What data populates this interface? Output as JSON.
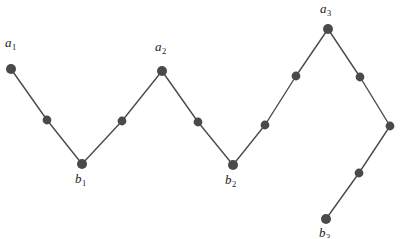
{
  "figure": {
    "type": "zigzag-path-diagram",
    "width": 400,
    "height": 238,
    "background_color": "#ffffff",
    "line_color": "#4a4a4a",
    "node_color": "#4a4a4a",
    "label_color": "#1a1a1a",
    "line_width": 1.4,
    "node_radius_labeled": 5.0,
    "node_radius_intermediate": 4.4
  },
  "path": {
    "description": "Polyline through all marked points from left to right",
    "points": [
      {
        "id": "a1",
        "x": 11,
        "y": 69,
        "labeled": true,
        "kind": "peak"
      },
      {
        "id": "p1",
        "x": 47,
        "y": 120,
        "labeled": false,
        "kind": "intermediate"
      },
      {
        "id": "b1",
        "x": 82,
        "y": 164,
        "labeled": true,
        "kind": "valley"
      },
      {
        "id": "p2",
        "x": 122,
        "y": 121,
        "labeled": false,
        "kind": "intermediate"
      },
      {
        "id": "a2",
        "x": 162,
        "y": 71,
        "labeled": true,
        "kind": "peak"
      },
      {
        "id": "p3",
        "x": 198,
        "y": 122,
        "labeled": false,
        "kind": "intermediate"
      },
      {
        "id": "b2",
        "x": 233,
        "y": 165,
        "labeled": true,
        "kind": "valley"
      },
      {
        "id": "p4",
        "x": 265,
        "y": 125,
        "labeled": false,
        "kind": "intermediate"
      },
      {
        "id": "p5",
        "x": 296,
        "y": 76,
        "labeled": false,
        "kind": "intermediate"
      },
      {
        "id": "a3",
        "x": 328,
        "y": 29,
        "labeled": true,
        "kind": "peak"
      },
      {
        "id": "p6",
        "x": 360,
        "y": 77,
        "labeled": false,
        "kind": "intermediate"
      },
      {
        "id": "p7",
        "x": 390,
        "y": 126,
        "labeled": false,
        "kind": "corner"
      },
      {
        "id": "p8",
        "x": 359,
        "y": 173,
        "labeled": false,
        "kind": "intermediate"
      },
      {
        "id": "b3",
        "x": 326,
        "y": 219,
        "labeled": true,
        "kind": "valley"
      }
    ]
  },
  "labels": [
    {
      "id": "a1",
      "base": "a",
      "sub": "1",
      "x": 5,
      "y": 36
    },
    {
      "id": "b1",
      "base": "b",
      "sub": "1",
      "x": 75,
      "y": 172
    },
    {
      "id": "a2",
      "base": "a",
      "sub": "2",
      "x": 155,
      "y": 40
    },
    {
      "id": "b2",
      "base": "b",
      "sub": "2",
      "x": 225,
      "y": 173
    },
    {
      "id": "a3",
      "base": "a",
      "sub": "3",
      "x": 320,
      "y": 2
    },
    {
      "id": "b3",
      "base": "b",
      "sub": "3",
      "x": 319,
      "y": 226
    }
  ],
  "chart_data": {
    "type": "line",
    "title": "",
    "xlabel": "",
    "ylabel": "",
    "grid": false,
    "legend": "none",
    "x": [
      11,
      47,
      82,
      122,
      162,
      198,
      233,
      265,
      296,
      328,
      360,
      390,
      359,
      326
    ],
    "y": [
      69,
      120,
      164,
      121,
      71,
      122,
      165,
      125,
      76,
      29,
      77,
      126,
      173,
      219
    ],
    "point_labels": [
      "a₁",
      "",
      "b₁",
      "",
      "a₂",
      "",
      "b₂",
      "",
      "",
      "a₃",
      "",
      "",
      "",
      "b₃"
    ],
    "series": [
      {
        "name": "zigzag-path",
        "values": [
          69,
          120,
          164,
          121,
          71,
          122,
          165,
          125,
          76,
          29,
          77,
          126,
          173,
          219
        ]
      }
    ],
    "xlim": [
      0,
      400
    ],
    "ylim": [
      238,
      0
    ]
  }
}
